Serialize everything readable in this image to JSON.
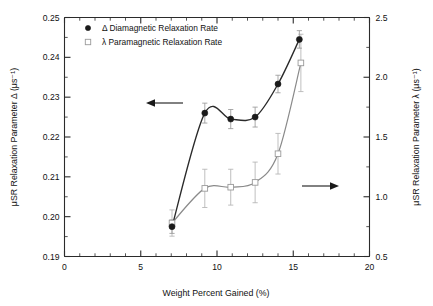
{
  "chart_data": {
    "type": "line",
    "title": "",
    "xlabel": "Weight Percent Gained (%)",
    "ylabel_left": "μSR Relaxation Parameter Δ (μs⁻¹)",
    "ylabel_right": "μSR Relaxation Parameter λ (μs⁻¹)",
    "xlim": [
      0,
      20
    ],
    "ylim_left": [
      0.19,
      0.25
    ],
    "ylim_right": [
      0.5,
      2.5
    ],
    "xticks": [
      0,
      5,
      10,
      15,
      20
    ],
    "xticklabels": [
      "0",
      "5",
      "10",
      "15",
      "20"
    ],
    "yticks_left": [
      0.19,
      0.2,
      0.21,
      0.22,
      0.23,
      0.24,
      0.25
    ],
    "yticklabels_left": [
      "0.19",
      "0.20",
      "0.21",
      "0.22",
      "0.23",
      "0.24",
      "0.25"
    ],
    "yticks_right": [
      0.5,
      1.0,
      1.5,
      2.0,
      2.5
    ],
    "yticklabels_right": [
      "0.5",
      "1.0",
      "1.5",
      "2.0",
      "2.5"
    ],
    "grid": false,
    "legend_position": "top-left",
    "series": [
      {
        "name": "Δ Diamagnetic Relaxation Rate",
        "axis": "left",
        "marker": "filled-circle",
        "color": "#1a1a1a",
        "x": [
          7.05,
          9.2,
          10.9,
          12.5,
          14.0,
          15.4
        ],
        "values": [
          0.1975,
          0.226,
          0.2245,
          0.225,
          0.2333,
          0.2445
        ],
        "yerr": [
          0.0017,
          0.0025,
          0.0024,
          0.0025,
          0.0022,
          0.0022
        ]
      },
      {
        "name": "λ Paramagnetic Relaxation Rate",
        "axis": "right",
        "marker": "open-square",
        "color": "#8a8a8a",
        "x": [
          7.05,
          9.2,
          10.9,
          12.5,
          14.0,
          15.5
        ],
        "values": [
          0.78,
          1.07,
          1.08,
          1.12,
          1.36,
          2.12
        ],
        "yerr": [
          0.11,
          0.16,
          0.15,
          0.17,
          0.17,
          0.24
        ]
      }
    ],
    "annotations": [
      {
        "name": "left-axis-arrow",
        "text": "",
        "direction": "left",
        "x": 9.0,
        "y_left": 0.2255
      },
      {
        "name": "right-axis-arrow",
        "text": "",
        "direction": "right",
        "x": 16.4,
        "y_right": 1.12
      }
    ]
  },
  "legend": {
    "entries": [
      {
        "label": "Δ Diamagnetic Relaxation Rate",
        "marker": "filled-circle"
      },
      {
        "label": "λ Paramagnetic Relaxation Rate",
        "marker": "open-square"
      }
    ]
  }
}
